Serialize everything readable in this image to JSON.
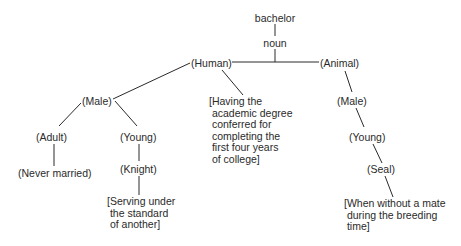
{
  "diagram": {
    "root": "bachelor",
    "pos": "noun",
    "human": {
      "label": "(Human)",
      "male": {
        "label": "(Male)",
        "adult": {
          "label": "(Adult)",
          "gloss": "(Never married)"
        },
        "young": {
          "label": "(Young)",
          "knight": {
            "label": "(Knight)",
            "gloss": "[Serving under\n the standard\n of another]"
          }
        }
      },
      "gloss": "[Having the\n academic degree\n conferred for\n completing the\n first four years\n of college]"
    },
    "animal": {
      "label": "(Animal)",
      "male": {
        "label": "(Male)",
        "young": {
          "label": "(Young)",
          "seal": {
            "label": "(Seal)",
            "gloss": "[When without a mate\n during the breeding\n time]"
          }
        }
      }
    }
  }
}
